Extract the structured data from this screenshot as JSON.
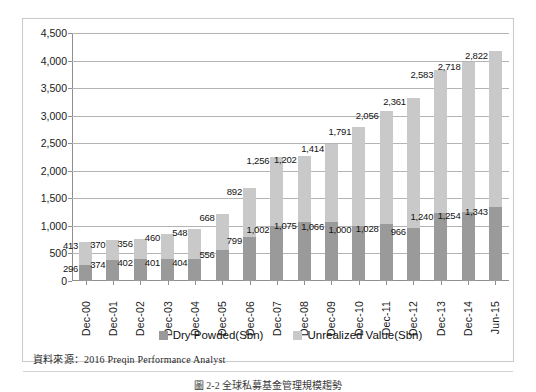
{
  "chart_data": {
    "type": "bar",
    "stacked": true,
    "title": "",
    "xlabel": "",
    "ylabel": "",
    "ylim": [
      0,
      4500
    ],
    "ytick_step": 500,
    "yticks": [
      "0",
      "500",
      "1,000",
      "1,500",
      "2,000",
      "2,500",
      "3,000",
      "3,500",
      "4,000",
      "4,500"
    ],
    "grid": true,
    "legend_position": "bottom",
    "categories": [
      "Dec-00",
      "Dec-01",
      "Dec-02",
      "Dec-03",
      "Dec-04",
      "Dec-05",
      "Dec-06",
      "Dec-07",
      "Dec-08",
      "Dec-09",
      "Dec-10",
      "Dec-11",
      "Dec-12",
      "Dec-13",
      "Dec-14",
      "Jun-15"
    ],
    "series": [
      {
        "name": "Dry Powded(Sbn)",
        "color": "#9a9a9a",
        "values": [
          296,
          374,
          402,
          401,
          404,
          556,
          799,
          1002,
          1075,
          1066,
          1000,
          1028,
          966,
          1240,
          1254,
          1343
        ],
        "labels": [
          "296",
          "374",
          "402",
          "401",
          "404",
          "556",
          "799",
          "1,002",
          "1,075",
          "1,066",
          "1,000",
          "1,028",
          "966",
          "1,240",
          "1,254",
          "1,343"
        ]
      },
      {
        "name": "Unrealized Value(Sbn)",
        "color": "#c9c9c9",
        "values": [
          413,
          370,
          356,
          460,
          548,
          668,
          892,
          1256,
          1202,
          1414,
          1791,
          2056,
          2361,
          2583,
          2718,
          2822
        ],
        "labels": [
          "413",
          "370",
          "356",
          "460",
          "548",
          "668",
          "892",
          "1,256",
          "1,202",
          "1,414",
          "1,791",
          "2,056",
          "2,361",
          "2,583",
          "2,718",
          "2,822"
        ]
      }
    ]
  },
  "legend": {
    "items": [
      {
        "label": "Dry Powded(Sbn)",
        "color": "#9a9a9a"
      },
      {
        "label": "Unrealized Value(Sbn)",
        "color": "#c9c9c9"
      }
    ]
  },
  "source": {
    "note": "資料來源：2016 Preqin Performance Analyst"
  },
  "caption": {
    "text": "圖 2-2  全球私募基金管理規模趨勢"
  }
}
